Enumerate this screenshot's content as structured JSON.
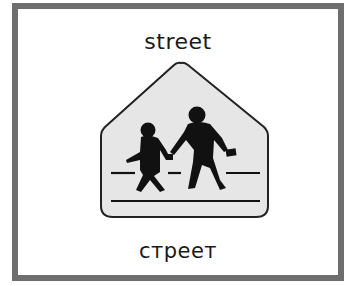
{
  "card": {
    "word_english": "street",
    "word_russian": "стреет",
    "border_color": "#6e6e6e"
  },
  "sign": {
    "shape": "pentagon school-crossing sign",
    "fill_color": "#e6e6e6",
    "outline_color": "#222222",
    "icon": "school-crossing-children-icon"
  }
}
